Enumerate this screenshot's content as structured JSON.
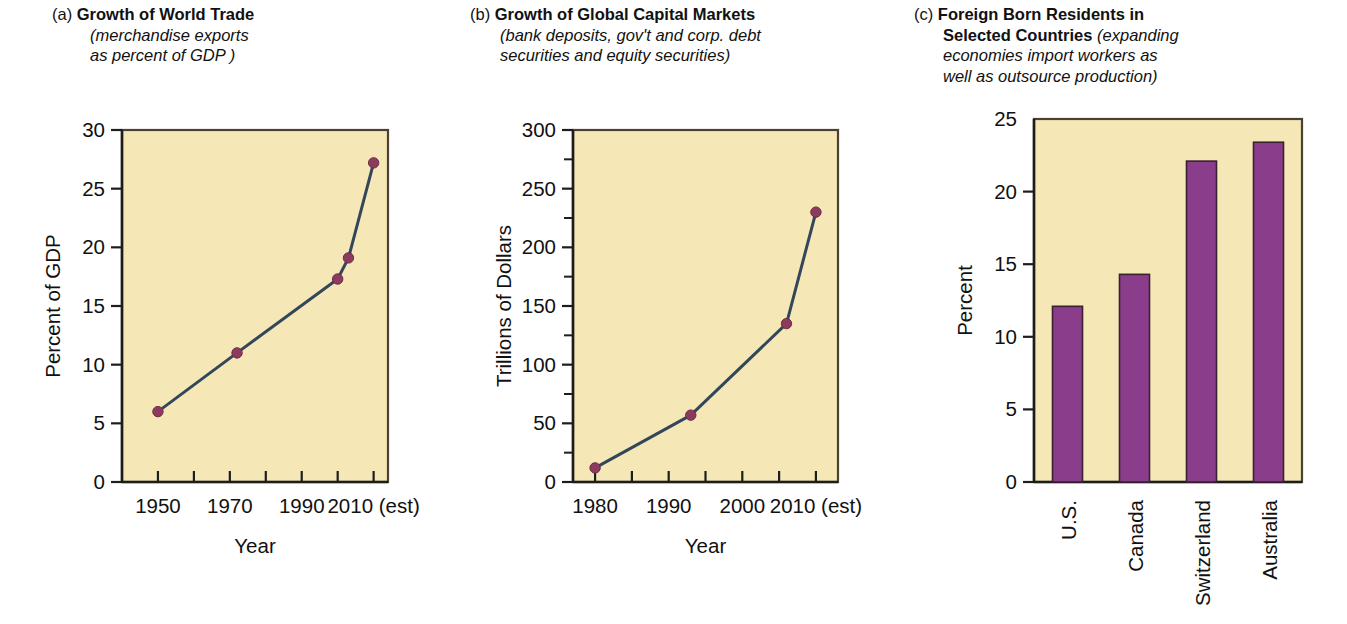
{
  "panels": {
    "a": {
      "tag": "(a)",
      "title": "Growth of World Trade",
      "sub_line1": "(merchandise exports",
      "sub_line2": "as percent of GDP )"
    },
    "b": {
      "tag": "(b)",
      "title": "Growth of Global Capital Markets",
      "sub_line1": "(bank deposits, gov't and corp. debt",
      "sub_line2": "securities and equity securities)"
    },
    "c": {
      "tag": "(c)",
      "title_line1": "Foreign Born Residents in",
      "title_line2": "Selected Countries",
      "sub_line2": "(expanding",
      "sub_line3": "economies import workers as",
      "sub_line4": "well as outsource production)"
    }
  },
  "colors": {
    "plot_background": "#f6e7b6",
    "line": "#33475b",
    "marker": "#8c3a5e",
    "bar": "#8a3d8a",
    "axis": "#1d1d1d",
    "page_background": "#ffffff"
  },
  "chart_data": [
    {
      "id": "a",
      "type": "line",
      "title": "Growth of World Trade",
      "subtitle": "merchandise exports as percent of GDP",
      "xlabel": "Year",
      "ylabel": "Percent of GDP",
      "xlim": [
        1940,
        2014
      ],
      "ylim": [
        0,
        30
      ],
      "yticks": [
        0,
        5,
        10,
        15,
        20,
        25,
        30
      ],
      "ytick_labels": [
        "0",
        "5",
        "10",
        "15",
        "20",
        "25",
        "30"
      ],
      "xticks": [
        1950,
        1960,
        1970,
        1980,
        1990,
        2000,
        2010
      ],
      "xtick_labels": [
        "1950",
        "",
        "1970",
        "",
        "1990",
        "",
        "2010 (est)"
      ],
      "grid": false,
      "legend": "none",
      "x": [
        1950,
        1972,
        2000,
        2003,
        2010
      ],
      "values": [
        6.0,
        11.0,
        17.3,
        19.1,
        27.2
      ]
    },
    {
      "id": "b",
      "type": "line",
      "title": "Growth of Global Capital Markets",
      "subtitle": "bank deposits, gov't and corp. debt securities and equity securities",
      "xlabel": "Year",
      "ylabel": "Trillions of Dollars",
      "xlim": [
        1977,
        2013
      ],
      "ylim": [
        0,
        300
      ],
      "yticks": [
        0,
        25,
        50,
        75,
        100,
        125,
        150,
        175,
        200,
        225,
        250,
        275,
        300
      ],
      "ytick_labels": [
        "0",
        "",
        "50",
        "",
        "100",
        "",
        "150",
        "",
        "200",
        "",
        "250",
        "",
        "300"
      ],
      "xticks": [
        1980,
        1985,
        1990,
        1995,
        2000,
        2005,
        2010
      ],
      "xtick_labels": [
        "1980",
        "",
        "1990",
        "",
        "2000",
        "",
        "2010 (est)"
      ],
      "grid": false,
      "legend": "none",
      "x": [
        1980,
        1993,
        2006,
        2010
      ],
      "values": [
        12,
        57,
        135,
        230
      ]
    },
    {
      "id": "c",
      "type": "bar",
      "title": "Foreign Born Residents in Selected Countries",
      "subtitle": "expanding economies import workers as well as outsource production",
      "xlabel": "",
      "ylabel": "Percent",
      "ylim": [
        0,
        25
      ],
      "yticks": [
        0,
        5,
        10,
        15,
        20,
        25
      ],
      "ytick_labels": [
        "0",
        "5",
        "10",
        "15",
        "20",
        "25"
      ],
      "grid": false,
      "legend": "none",
      "categories": [
        "U.S.",
        "Canada",
        "Switzerland",
        "Australia"
      ],
      "values": [
        12.1,
        14.3,
        22.1,
        23.4
      ]
    }
  ]
}
